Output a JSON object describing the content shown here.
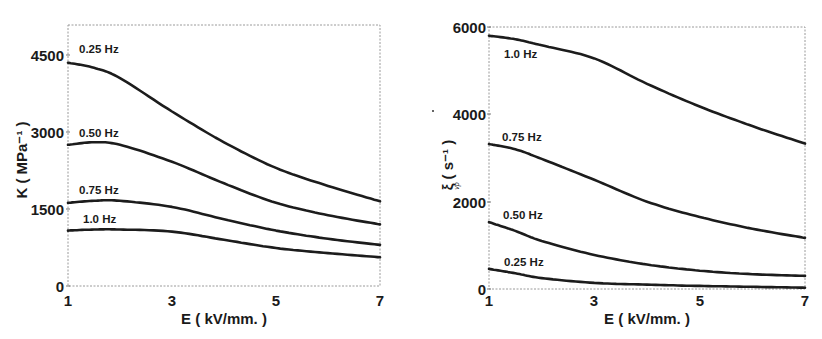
{
  "chart_data": [
    {
      "type": "line",
      "title": "",
      "xlabel": "E ( kV/mm. )",
      "ylabel": "K ( MPa⁻¹ )",
      "xlim": [
        1,
        7
      ],
      "ylim": [
        0,
        4500
      ],
      "xticks": [
        1,
        3,
        5,
        7
      ],
      "yticks": [
        0,
        1500,
        3000,
        4500
      ],
      "grid": false,
      "legend": "inline curve labels",
      "x": [
        1,
        1.5,
        2,
        3,
        4,
        5,
        6,
        7
      ],
      "series": [
        {
          "name": "0.25 Hz",
          "values": [
            4350,
            4250,
            4050,
            3400,
            2800,
            2300,
            1950,
            1650
          ]
        },
        {
          "name": "0.50 Hz",
          "values": [
            2750,
            2800,
            2750,
            2420,
            2000,
            1620,
            1380,
            1200
          ]
        },
        {
          "name": "0.75 Hz",
          "values": [
            1620,
            1660,
            1660,
            1540,
            1300,
            1080,
            920,
            800
          ]
        },
        {
          "name": "1.0 Hz",
          "values": [
            1080,
            1100,
            1100,
            1060,
            900,
            740,
            640,
            560
          ]
        }
      ]
    },
    {
      "type": "line",
      "title": "",
      "xlabel": "E ( kV/mm. )",
      "ylabel": "ξᵥₚ ( s⁻¹ )",
      "xlim": [
        1,
        7
      ],
      "ylim": [
        0,
        6000
      ],
      "xticks": [
        1,
        3,
        5,
        7
      ],
      "yticks": [
        0,
        2000,
        4000,
        6000
      ],
      "grid": false,
      "legend": "inline curve labels",
      "x": [
        1,
        1.5,
        2,
        3,
        4,
        5,
        6,
        7
      ],
      "series": [
        {
          "name": "1.0 Hz",
          "values": [
            5800,
            5720,
            5580,
            5280,
            4700,
            4180,
            3730,
            3330
          ]
        },
        {
          "name": "0.75 Hz",
          "values": [
            3320,
            3200,
            2980,
            2500,
            2000,
            1650,
            1380,
            1170
          ]
        },
        {
          "name": "0.50 Hz",
          "values": [
            1530,
            1330,
            1100,
            780,
            560,
            420,
            340,
            300
          ]
        },
        {
          "name": "0.25 Hz",
          "values": [
            460,
            360,
            250,
            140,
            100,
            70,
            50,
            30
          ]
        }
      ]
    }
  ],
  "panels": [
    {
      "y_axis_title": "K ( MPa⁻¹ )",
      "x_axis_title": "E ( kV/mm. )",
      "x_tick_labels": [
        "1",
        "3",
        "5",
        "7"
      ],
      "y_tick_labels": [
        "0",
        "1500",
        "3000",
        "4500"
      ],
      "curve_labels": [
        "0.25 Hz",
        "0.50 Hz",
        "0.75 Hz",
        "1.0 Hz"
      ]
    },
    {
      "y_axis_title": "ξ ( s⁻¹ )",
      "y_axis_subscript": "vp",
      "x_axis_title": "E ( kV/mm. )",
      "x_tick_labels": [
        "1",
        "3",
        "5",
        "7"
      ],
      "y_tick_labels": [
        "0",
        "2000",
        "4000",
        "6000"
      ],
      "curve_labels": [
        "1.0 Hz",
        "0.75 Hz",
        "0.50 Hz",
        "0.25 Hz"
      ]
    }
  ]
}
